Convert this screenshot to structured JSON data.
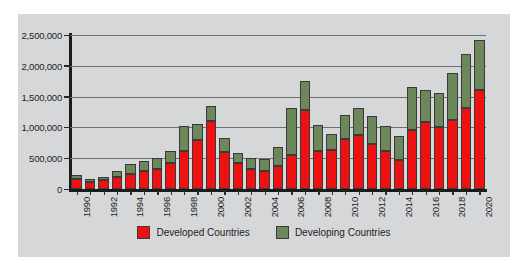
{
  "chart_data": {
    "type": "bar",
    "subtype": "stacked-bar",
    "title": "",
    "xlabel": "",
    "ylabel": "",
    "ylim": [
      0,
      2500000
    ],
    "ytick_labels": [
      "2,500,000",
      "2,000,000",
      "1,500,000",
      "1,000,000",
      "500,000",
      "0"
    ],
    "ytick_values": [
      2500000,
      2000000,
      1500000,
      1000000,
      500000,
      0
    ],
    "grid": true,
    "legend_position": "bottom",
    "categories": [
      "1990",
      "1991",
      "1992",
      "1993",
      "1994",
      "1995",
      "1996",
      "1997",
      "1998",
      "1999",
      "2000",
      "2001",
      "2002",
      "2003",
      "2004",
      "2005",
      "2006",
      "2007",
      "2008",
      "2009",
      "2010",
      "2011",
      "2012",
      "2013",
      "2014",
      "2015",
      "2016",
      "2017",
      "2018",
      "2019",
      "2020"
    ],
    "xtick_labels": [
      "1990",
      "1992",
      "1994",
      "1996",
      "1998",
      "2000",
      "2002",
      "2004",
      "2006",
      "2008",
      "2010",
      "2012",
      "2014",
      "2016",
      "2018",
      "2020"
    ],
    "series": [
      {
        "name": "Developed Countries",
        "color": "#ee1111",
        "values": [
          170000,
          120000,
          140000,
          200000,
          250000,
          300000,
          330000,
          430000,
          620000,
          800000,
          1100000,
          600000,
          420000,
          330000,
          290000,
          380000,
          550000,
          1280000,
          620000,
          640000,
          810000,
          880000,
          730000,
          610000,
          470000,
          960000,
          1080000,
          1010000,
          1120000,
          1310000,
          1600000
        ]
      },
      {
        "name": "Developing Countries",
        "color": "#6c8759",
        "values": [
          60000,
          40000,
          60000,
          90000,
          150000,
          160000,
          180000,
          190000,
          400000,
          260000,
          250000,
          230000,
          160000,
          180000,
          190000,
          310000,
          760000,
          480000,
          420000,
          260000,
          390000,
          440000,
          450000,
          420000,
          390000,
          700000,
          530000,
          550000,
          770000,
          890000,
          820000
        ]
      }
    ],
    "totals": [
      230000,
      160000,
      200000,
      290000,
      400000,
      460000,
      510000,
      620000,
      1020000,
      1060000,
      1350000,
      830000,
      580000,
      510000,
      480000,
      690000,
      1310000,
      1760000,
      1040000,
      900000,
      1200000,
      1320000,
      1180000,
      1030000,
      860000,
      1660000,
      1610000,
      1560000,
      1890000,
      2200000,
      2420000
    ]
  },
  "legend": {
    "entries": [
      {
        "label": "Developed Countries",
        "color": "#ee1111"
      },
      {
        "label": "Developing Countries",
        "color": "#6c8759"
      }
    ]
  }
}
